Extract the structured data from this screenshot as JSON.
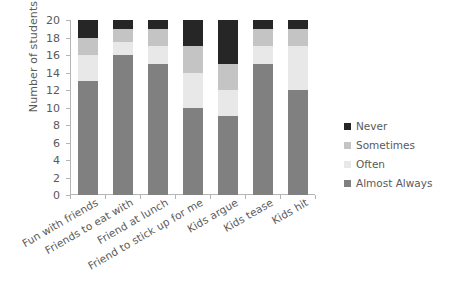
{
  "chart_data": {
    "type": "bar",
    "subtype": "stacked-vertical",
    "title": "",
    "xlabel": "",
    "ylabel": "Number of students",
    "ylim": [
      0,
      20
    ],
    "ytick_step": 2,
    "yticks": [
      0,
      2,
      4,
      6,
      8,
      10,
      12,
      14,
      16,
      18,
      20
    ],
    "grid": false,
    "legend_position": "right",
    "categories": [
      "Fun with friends",
      "Friends to eat with",
      "Friend at lunch",
      "Friend to stick up for me",
      "Kids argue",
      "Kids tease",
      "Kids hit"
    ],
    "series": [
      {
        "name": "Almost Always",
        "color": "#808080",
        "values": [
          13,
          16,
          15,
          10,
          9,
          15,
          12
        ]
      },
      {
        "name": "Often",
        "color": "#e8e8e8",
        "values": [
          3,
          1.5,
          2,
          4,
          3,
          2,
          5
        ]
      },
      {
        "name": "Sometimes",
        "color": "#c4c4c4",
        "values": [
          2,
          1.5,
          2,
          3,
          3,
          2,
          2
        ]
      },
      {
        "name": "Never",
        "color": "#262626",
        "values": [
          2,
          1,
          1,
          3,
          5,
          1,
          1
        ]
      }
    ],
    "stack_order_bottom_to_top": [
      "Almost Always",
      "Often",
      "Sometimes",
      "Never"
    ],
    "cumulative_tops": {
      "Fun with friends": [
        13,
        16,
        18,
        20
      ],
      "Friends to eat with": [
        16,
        17.5,
        19,
        20
      ],
      "Friend at lunch": [
        15,
        17,
        19,
        20
      ],
      "Friend to stick up for me": [
        10,
        14,
        17,
        20
      ],
      "Kids argue": [
        9,
        12,
        15,
        20
      ],
      "Kids tease": [
        15,
        17,
        19,
        20
      ],
      "Kids hit": [
        12,
        17,
        19,
        20
      ]
    }
  },
  "legend": {
    "items": [
      {
        "label": "Never",
        "color": "#262626"
      },
      {
        "label": "Sometimes",
        "color": "#c4c4c4"
      },
      {
        "label": "Often",
        "color": "#e8e8e8"
      },
      {
        "label": "Almost Always",
        "color": "#808080"
      }
    ]
  },
  "axis": {
    "y_title": "Number of students"
  }
}
